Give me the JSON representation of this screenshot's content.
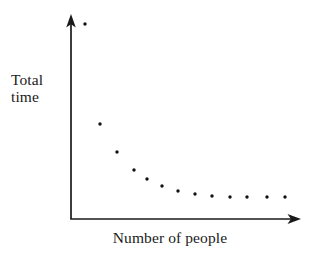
{
  "figure": {
    "title": "",
    "background_color": "#ffffff",
    "ink_color": "#1a1a1a",
    "width": 318,
    "height": 259
  },
  "labels": {
    "y_line1": "Total",
    "y_line2": "time",
    "x_label": "Number of people"
  },
  "axes": {
    "origin": {
      "x": 71,
      "y": 219
    },
    "y_top": 16,
    "x_right": 300,
    "arrow_style": "open-arrowhead",
    "tick_labels_x": [],
    "tick_labels_y": [],
    "grid": false
  },
  "chart_data": {
    "type": "scatter",
    "title": "",
    "subtitle": "",
    "xlabel": "Number of people",
    "ylabel": "Total time",
    "grid": false,
    "legend": null,
    "legend_position": "none",
    "annotations": [],
    "axis_ticks_shown": false,
    "axis_numbers_shown": false,
    "marker": {
      "shape": "circle",
      "size_px": 3.4,
      "color": "#111111"
    },
    "xlim": [
      0,
      14
    ],
    "ylim": [
      0,
      10
    ],
    "x": [
      1,
      2,
      3,
      4,
      5,
      6,
      7,
      8,
      9,
      10,
      11,
      12,
      13
    ],
    "y": [
      9.6,
      4.7,
      3.3,
      2.4,
      2.0,
      1.6,
      1.4,
      1.25,
      1.15,
      1.08,
      1.08,
      1.08,
      1.08
    ],
    "points_px": [
      {
        "x": 85,
        "y": 24
      },
      {
        "x": 100,
        "y": 124
      },
      {
        "x": 117,
        "y": 152
      },
      {
        "x": 134,
        "y": 170
      },
      {
        "x": 147,
        "y": 179
      },
      {
        "x": 162,
        "y": 186
      },
      {
        "x": 178,
        "y": 191
      },
      {
        "x": 195,
        "y": 194
      },
      {
        "x": 212,
        "y": 196
      },
      {
        "x": 230,
        "y": 197
      },
      {
        "x": 247,
        "y": 197
      },
      {
        "x": 267,
        "y": 197
      },
      {
        "x": 285,
        "y": 197
      }
    ]
  }
}
